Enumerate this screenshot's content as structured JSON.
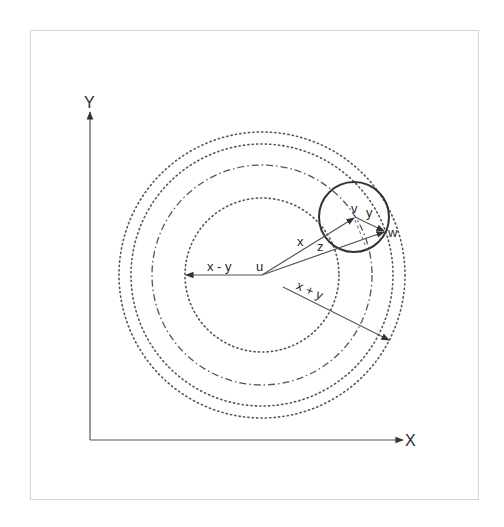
{
  "diagram": {
    "colors": {
      "stroke": "#555555",
      "circle": "#333333",
      "text": "#2a2a2a",
      "frame": "#d6d6d6"
    },
    "axes": {
      "origin": [
        90,
        440
      ],
      "y_label": "Y",
      "x_label": "X",
      "y_tip": [
        90,
        110
      ],
      "x_tip": [
        405,
        440
      ]
    },
    "center": {
      "label": "u",
      "point": [
        262,
        275
      ]
    },
    "circles": [
      {
        "name": "inner-dotted",
        "r": 77,
        "style": "dotted"
      },
      {
        "name": "dash-dot",
        "r": 110,
        "style": "dashdot"
      },
      {
        "name": "middle-dotted",
        "r": 131,
        "style": "dotted"
      },
      {
        "name": "outer-dotted",
        "r": 143,
        "style": "dotted"
      }
    ],
    "small_circle": {
      "center": [
        354,
        217
      ],
      "r": 35
    },
    "vectors": [
      {
        "name": "x",
        "label": "x",
        "from": [
          262,
          275
        ],
        "to": [
          355,
          217
        ]
      },
      {
        "name": "y",
        "label": "y",
        "from": [
          355,
          217
        ],
        "to": [
          385,
          231
        ]
      },
      {
        "name": "z",
        "label": "z",
        "from": [
          262,
          275
        ],
        "to": [
          385,
          231
        ]
      },
      {
        "name": "x-minus-y",
        "label": "x - y",
        "from": [
          262,
          275
        ],
        "to": [
          185,
          275
        ]
      },
      {
        "name": "x-plus-y",
        "label": "x + y",
        "from": [
          282,
          285
        ],
        "to": [
          390,
          340
        ]
      }
    ],
    "point_labels": {
      "u": "u",
      "v": "v",
      "w": "w"
    },
    "vector_labels": {
      "x": "x",
      "y": "y",
      "z": "z",
      "x_minus_y": "x - y",
      "x_plus_y": "x + y"
    }
  }
}
